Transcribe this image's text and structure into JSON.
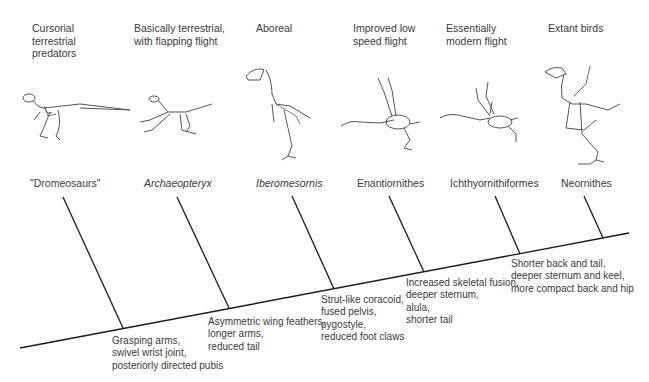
{
  "diagram": {
    "type": "cladogram",
    "clades": [
      {
        "habit": "Cursorial\nterrestrial\npredators",
        "taxon": "\"Dromeosaurs\"",
        "italic": false,
        "skeleton_icon": "dromaeosaur-skeleton-icon"
      },
      {
        "habit": "Basically terrestrial,\nwith flapping flight",
        "taxon": "Archaeopteryx",
        "italic": true,
        "skeleton_icon": "archaeopteryx-skeleton-icon"
      },
      {
        "habit": "Aboreal",
        "taxon": "Iberomesornis",
        "italic": true,
        "skeleton_icon": "iberomesornis-skeleton-icon"
      },
      {
        "habit": "Improved low\nspeed flight",
        "taxon": "Enantiornithes",
        "italic": false,
        "skeleton_icon": "enantiornithes-skeleton-icon"
      },
      {
        "habit": "Essentially\nmodern flight",
        "taxon": "Ichthyornithiformes",
        "italic": false,
        "skeleton_icon": "ichthyornis-skeleton-icon"
      },
      {
        "habit": "Extant birds",
        "taxon": "Neornithes",
        "italic": false,
        "skeleton_icon": "neornithes-skeleton-icon"
      }
    ],
    "traits": [
      "Grasping arms,\nswivel wrist joint,\nposteriorly directed pubis",
      "Asymmetric wing feathers,\nlonger arms,\nreduced tail",
      "Strut-like coracoid,\nfused pelvis,\npygostyle,\nreduced foot claws",
      "Increased skeletal fusion,\ndeeper sternum,\nalula,\nshorter tail",
      "Shorter back and tail,\ndeeper sternum and keel,\nmore compact back and hip"
    ],
    "colors": {
      "line": "#1a1a1a",
      "text": "#3a3a3a",
      "skeleton": "#555555"
    }
  }
}
